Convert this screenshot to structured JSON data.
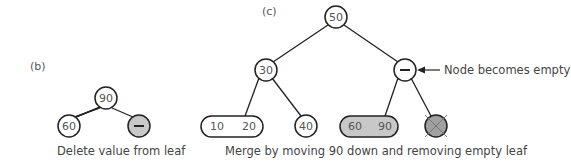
{
  "panel_b": {
    "label": "(b)",
    "root": "90",
    "left": "60",
    "right": "–",
    "caption": "Delete value from leaf"
  },
  "panel_c": {
    "label": "(c)",
    "root": "50",
    "left": "30",
    "right": "–",
    "leaf_a1": "10",
    "leaf_a2": "20",
    "leaf_b": "40",
    "leaf_c1": "60",
    "leaf_c2": "90",
    "annotation": "Node becomes empty",
    "caption": "Merge by moving 90 down and removing empty leaf"
  },
  "colors": {
    "stroke": "#222222",
    "fill_shaded": "#c8c8c8",
    "text": "#555555"
  }
}
